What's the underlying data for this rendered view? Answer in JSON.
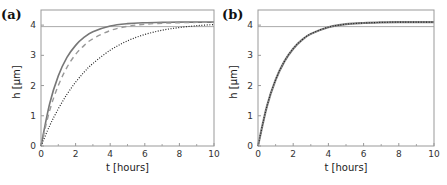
{
  "chart_data": [
    {
      "panel": "(a)",
      "type": "line",
      "title": "",
      "xlabel": "t [hours]",
      "ylabel": "h [µm]",
      "xlim": [
        0,
        10
      ],
      "ylim": [
        0,
        4.5
      ],
      "xticks": [
        0,
        2,
        4,
        6,
        8,
        10
      ],
      "yticks": [
        0,
        1,
        2,
        3,
        4
      ],
      "grid": false,
      "legend": null,
      "reference_line": {
        "y": 3.95,
        "color": "#aaaaaa"
      },
      "x": [
        0,
        0.5,
        1,
        1.5,
        2,
        2.5,
        3,
        4,
        5,
        6,
        7,
        8,
        9,
        10
      ],
      "series": [
        {
          "name": "solid",
          "style": "solid",
          "color": "#777777",
          "values": [
            0,
            1.4,
            2.32,
            2.93,
            3.33,
            3.6,
            3.78,
            3.97,
            4.05,
            4.08,
            4.09,
            4.1,
            4.1,
            4.1
          ]
        },
        {
          "name": "dashed",
          "style": "dashed",
          "color": "#999999",
          "values": [
            0,
            1.17,
            2.0,
            2.6,
            3.03,
            3.33,
            3.55,
            3.82,
            3.96,
            4.03,
            4.06,
            4.08,
            4.09,
            4.1
          ]
        },
        {
          "name": "dotted",
          "style": "dotted",
          "color": "#222222",
          "values": [
            0,
            0.67,
            1.23,
            1.71,
            2.11,
            2.45,
            2.73,
            3.17,
            3.48,
            3.69,
            3.83,
            3.92,
            3.98,
            4.02
          ]
        }
      ]
    },
    {
      "panel": "(b)",
      "type": "line",
      "title": "",
      "xlabel": "t [hours]",
      "ylabel": "h [µm]",
      "xlim": [
        0,
        10
      ],
      "ylim": [
        0,
        4.5
      ],
      "xticks": [
        0,
        2,
        4,
        6,
        8,
        10
      ],
      "yticks": [
        0,
        1,
        2,
        3,
        4
      ],
      "grid": false,
      "legend": null,
      "reference_line": {
        "y": 3.95,
        "color": "#aaaaaa"
      },
      "x": [
        0,
        0.5,
        1,
        1.5,
        2,
        2.5,
        3,
        4,
        5,
        6,
        7,
        8,
        9,
        10
      ],
      "series": [
        {
          "name": "solid",
          "style": "solid",
          "color": "#888888",
          "values": [
            0,
            1.3,
            2.19,
            2.8,
            3.22,
            3.51,
            3.71,
            3.93,
            4.03,
            4.07,
            4.09,
            4.1,
            4.1,
            4.1
          ]
        },
        {
          "name": "dotted",
          "style": "dotted",
          "color": "#222222",
          "values": [
            0,
            1.3,
            2.19,
            2.8,
            3.22,
            3.51,
            3.71,
            3.93,
            4.03,
            4.07,
            4.09,
            4.1,
            4.1,
            4.1
          ]
        }
      ]
    }
  ],
  "panels": {
    "a": {
      "label": "(a)",
      "xlabel": "t [hours]",
      "ylabel": "h [µm]"
    },
    "b": {
      "label": "(b)",
      "xlabel": "t [hours]",
      "ylabel": "h [µm]"
    }
  }
}
